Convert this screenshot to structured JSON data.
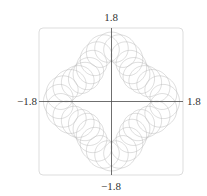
{
  "chart_data": {
    "type": "line",
    "subtype": "parametric-curve",
    "title": "",
    "xlabel": "",
    "ylabel": "",
    "xlim": [
      -1.8,
      1.8
    ],
    "ylim": [
      -1.8,
      1.8
    ],
    "grid": false,
    "legend": "none",
    "axes_through_origin": true,
    "tick_labels": {
      "x_min": "−1.8",
      "x_max": "1.8",
      "y_min": "−1.8",
      "y_max": "1.8"
    },
    "series": [
      {
        "name": "curve",
        "parametric": {
          "description": "z(t) = (R + A cos(4t)) e^{it} + r e^{iNt}, t in [0, 2π]",
          "R": 1.12,
          "A": 0.22,
          "lobes": 4,
          "r": 0.36,
          "N": 37,
          "t_range": [
            0,
            6.2832
          ],
          "samples": 4000
        }
      }
    ],
    "colors": {
      "curve": "#b8b8b8",
      "axes": "#4a4a4a",
      "frame": "#dddddd"
    }
  }
}
